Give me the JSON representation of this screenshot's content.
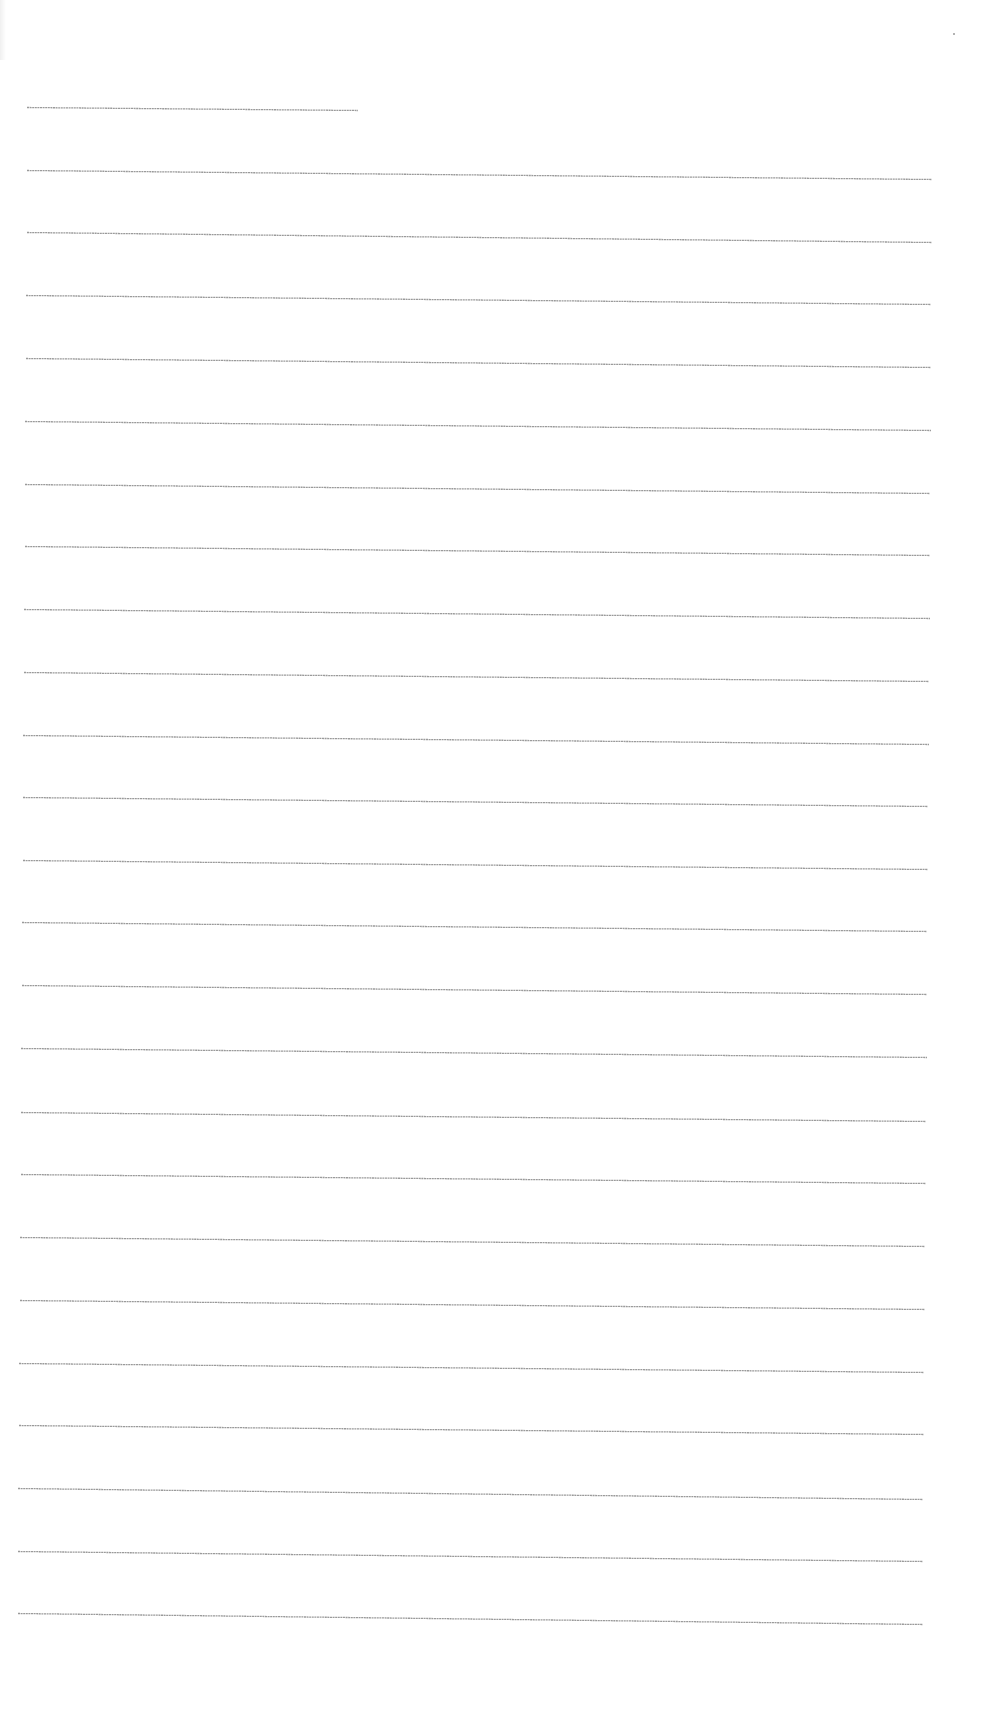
{
  "document": {
    "type": "lined-paper",
    "background_color": "#ffffff",
    "line_color": "#9a9a9a",
    "line_thickness_px": 1,
    "line_style": "dotted-fine",
    "header_line": {
      "x1": 27,
      "y1": 107,
      "x2": 358,
      "y2": 110
    },
    "lines": [
      {
        "x1": 27,
        "y1": 170,
        "x2": 932,
        "y2": 179
      },
      {
        "x1": 27,
        "y1": 232,
        "x2": 932,
        "y2": 242
      },
      {
        "x1": 26,
        "y1": 295,
        "x2": 931,
        "y2": 304
      },
      {
        "x1": 26,
        "y1": 358,
        "x2": 931,
        "y2": 367
      },
      {
        "x1": 25,
        "y1": 421,
        "x2": 931,
        "y2": 430
      },
      {
        "x1": 25,
        "y1": 484,
        "x2": 930,
        "y2": 493
      },
      {
        "x1": 25,
        "y1": 546,
        "x2": 930,
        "y2": 555
      },
      {
        "x1": 24,
        "y1": 609,
        "x2": 930,
        "y2": 618
      },
      {
        "x1": 24,
        "y1": 672,
        "x2": 929,
        "y2": 681
      },
      {
        "x1": 23,
        "y1": 735,
        "x2": 929,
        "y2": 744
      },
      {
        "x1": 23,
        "y1": 797,
        "x2": 928,
        "y2": 806
      },
      {
        "x1": 23,
        "y1": 860,
        "x2": 928,
        "y2": 869
      },
      {
        "x1": 22,
        "y1": 922,
        "x2": 927,
        "y2": 931
      },
      {
        "x1": 22,
        "y1": 985,
        "x2": 927,
        "y2": 994
      },
      {
        "x1": 21,
        "y1": 1048,
        "x2": 927,
        "y2": 1057
      },
      {
        "x1": 21,
        "y1": 1112,
        "x2": 926,
        "y2": 1121
      },
      {
        "x1": 21,
        "y1": 1174,
        "x2": 926,
        "y2": 1183
      },
      {
        "x1": 20,
        "y1": 1237,
        "x2": 925,
        "y2": 1246
      },
      {
        "x1": 20,
        "y1": 1300,
        "x2": 925,
        "y2": 1309
      },
      {
        "x1": 19,
        "y1": 1363,
        "x2": 924,
        "y2": 1372
      },
      {
        "x1": 19,
        "y1": 1425,
        "x2": 924,
        "y2": 1434
      },
      {
        "x1": 18,
        "y1": 1488,
        "x2": 923,
        "y2": 1499
      },
      {
        "x1": 18,
        "y1": 1551,
        "x2": 923,
        "y2": 1561
      },
      {
        "x1": 18,
        "y1": 1613,
        "x2": 923,
        "y2": 1624
      }
    ],
    "specks": [
      {
        "x": 953,
        "y": 33
      }
    ]
  }
}
